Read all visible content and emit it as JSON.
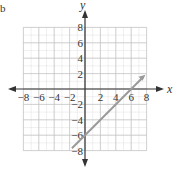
{
  "chart_data": {
    "type": "line",
    "title": "",
    "xlabel": "x",
    "ylabel": "y",
    "xlim": [
      -8,
      8
    ],
    "ylim": [
      -8,
      8
    ],
    "grid": true,
    "x_ticks": [
      "-8",
      "-6",
      "-4",
      "-2",
      "2",
      "4",
      "6",
      "8"
    ],
    "y_ticks": [
      "8",
      "6",
      "4",
      "2",
      "-2",
      "-4",
      "-6",
      "-8"
    ],
    "series": [
      {
        "name": "y = x - 6",
        "color": "#9a9a9a",
        "x": [
          -1.7,
          0,
          6,
          7.6
        ],
        "y": [
          -7.7,
          -6,
          0,
          1.6
        ]
      }
    ]
  },
  "labels": {
    "x_axis": "x",
    "y_axis": "y",
    "corner_mark": "b"
  }
}
